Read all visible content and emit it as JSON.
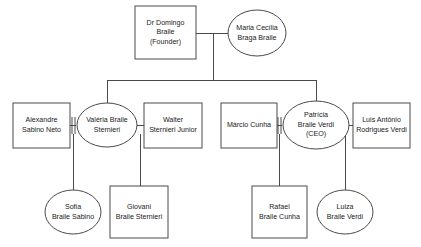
{
  "diagram": {
    "type": "genogram",
    "background_color": "#ffffff",
    "stroke_color": "#4a4a4a",
    "text_color": "#1a1a1a"
  },
  "nodes": [
    {
      "id": "domingo",
      "shape": "rectangle",
      "generation": 1,
      "lines": [
        "Dr Domingo",
        "Braile",
        "(Founder)"
      ]
    },
    {
      "id": "maria",
      "shape": "ellipse",
      "generation": 1,
      "lines": [
        "Maria Cecília",
        "Braga Braile"
      ]
    },
    {
      "id": "alexandre",
      "shape": "rectangle",
      "generation": 2,
      "lines": [
        "Alexandre",
        "Sabino Neto"
      ]
    },
    {
      "id": "valeria",
      "shape": "ellipse",
      "generation": 2,
      "lines": [
        "Valéria Braile",
        "Sternieri"
      ]
    },
    {
      "id": "walter",
      "shape": "rectangle",
      "generation": 2,
      "lines": [
        "Walter",
        "Sternieri Junior"
      ]
    },
    {
      "id": "marcio",
      "shape": "rectangle",
      "generation": 2,
      "lines": [
        "Márcio Cunha"
      ]
    },
    {
      "id": "patricia",
      "shape": "ellipse",
      "generation": 2,
      "lines": [
        "Patrícia",
        "Braile Verdi",
        "(CEO)"
      ]
    },
    {
      "id": "luis",
      "shape": "rectangle",
      "generation": 2,
      "lines": [
        "Luis Antônio",
        "Rodrigues Verdi"
      ]
    },
    {
      "id": "sofia",
      "shape": "ellipse",
      "generation": 3,
      "lines": [
        "Sofia",
        "Braile Sabino"
      ]
    },
    {
      "id": "giovani",
      "shape": "rectangle",
      "generation": 3,
      "lines": [
        "Giovani",
        "Braile Sternieri"
      ]
    },
    {
      "id": "rafael",
      "shape": "rectangle",
      "generation": 3,
      "lines": [
        "Rafael",
        "Braile Cunha"
      ]
    },
    {
      "id": "luiza",
      "shape": "ellipse",
      "generation": 3,
      "lines": [
        "Luiza",
        "Braile Verdi"
      ]
    }
  ],
  "relations": [
    {
      "type": "marriage",
      "from": "domingo",
      "to": "maria"
    },
    {
      "type": "marriage",
      "from": "alexandre",
      "to": "valeria"
    },
    {
      "type": "marriage",
      "from": "valeria",
      "to": "walter"
    },
    {
      "type": "marriage",
      "from": "marcio",
      "to": "patricia"
    },
    {
      "type": "marriage",
      "from": "patricia",
      "to": "luis"
    },
    {
      "type": "child",
      "from": "domingo-maria",
      "to": "valeria"
    },
    {
      "type": "child",
      "from": "domingo-maria",
      "to": "patricia"
    },
    {
      "type": "child",
      "from": "alexandre-valeria",
      "to": "sofia"
    },
    {
      "type": "child",
      "from": "valeria-walter",
      "to": "giovani"
    },
    {
      "type": "child",
      "from": "marcio-patricia",
      "to": "rafael"
    },
    {
      "type": "child",
      "from": "patricia-luis",
      "to": "luiza"
    }
  ]
}
